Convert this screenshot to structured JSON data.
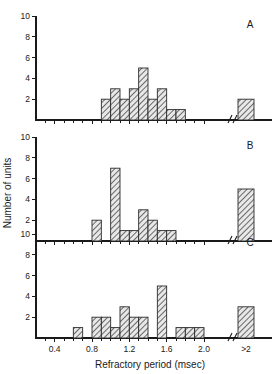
{
  "figure": {
    "xlabel": "Refractory period (msec)",
    "ylabel": "Number of units",
    "panel_letters": [
      "A",
      "B",
      "C"
    ],
    "x_tick_labels": [
      "0.4",
      "0.8",
      "1.2",
      "1.6",
      "2.0",
      ">2"
    ],
    "y_tick_labels": [
      "2",
      "4",
      "6",
      "8",
      "10"
    ],
    "axis_break_label": "axis-break"
  },
  "chart_data": {
    "type": "bar",
    "title": "",
    "xlabel": "Refractory period (msec)",
    "ylabel": "Number of units",
    "xlim": [
      0.2,
      2.3
    ],
    "ylim": [
      0,
      10
    ],
    "bin_width": 0.1,
    "grid": false,
    "legend": false,
    "axis_break_before_overflow_bin": true,
    "x_ticks": [
      0.4,
      0.8,
      1.2,
      1.6,
      2.0
    ],
    "x_tick_labels": [
      "0.4",
      "0.8",
      "1.2",
      "1.6",
      "2.0",
      ">2"
    ],
    "y_ticks": [
      2,
      4,
      6,
      8,
      10
    ],
    "overflow_bin_label": ">2",
    "panels": [
      {
        "panel": "A",
        "bin_starts": [
          0.9,
          1.0,
          1.1,
          1.2,
          1.3,
          1.4,
          1.5,
          1.6,
          1.7
        ],
        "values": [
          2,
          3,
          2,
          3,
          5,
          2,
          3,
          1,
          1
        ],
        "overflow_value": 2
      },
      {
        "panel": "B",
        "bin_starts": [
          0.8,
          1.0,
          1.1,
          1.2,
          1.3,
          1.4,
          1.5,
          1.6
        ],
        "values": [
          2,
          7,
          1,
          1,
          3,
          2,
          1,
          1
        ],
        "overflow_value": 5
      },
      {
        "panel": "C",
        "bin_starts": [
          0.6,
          0.8,
          0.9,
          1.0,
          1.1,
          1.2,
          1.3,
          1.5,
          1.7,
          1.8,
          1.9
        ],
        "values": [
          1,
          2,
          2,
          1,
          3,
          2,
          2,
          5,
          1,
          1,
          1
        ],
        "overflow_value": 3
      }
    ]
  }
}
